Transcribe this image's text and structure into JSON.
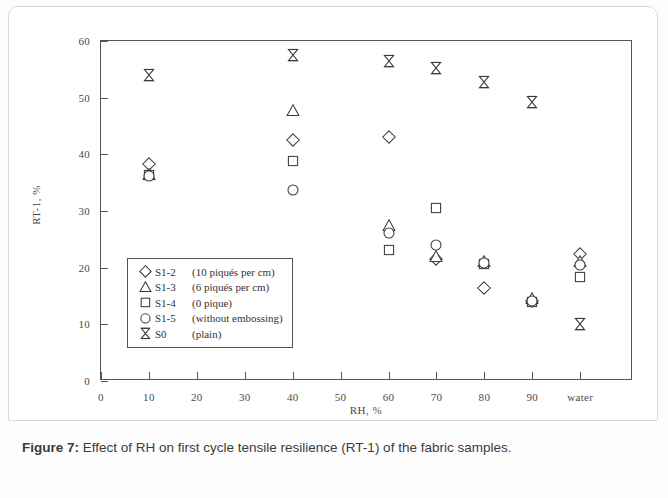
{
  "figure": {
    "caption_label": "Figure 7:",
    "caption_text": " Effect of RH on first cycle tensile resilience (RT-1) of the fabric samples."
  },
  "chart_data": {
    "type": "scatter",
    "title": "",
    "xlabel": "RH, %",
    "ylabel": "RT-1, %",
    "xticklabels": [
      "0",
      "10",
      "20",
      "30",
      "40",
      "50",
      "60",
      "70",
      "80",
      "90",
      "water"
    ],
    "xtickvalues": [
      0,
      10,
      20,
      30,
      40,
      50,
      60,
      70,
      80,
      90,
      100
    ],
    "yticklabels": [
      "0",
      "10",
      "20",
      "30",
      "40",
      "50",
      "60"
    ],
    "ytickvalues": [
      0,
      10,
      20,
      30,
      40,
      50,
      60
    ],
    "xlim": [
      0,
      111
    ],
    "ylim": [
      0,
      60
    ],
    "grid": false,
    "legend_position": "inside-lower-left",
    "series": [
      {
        "name": "S1-2",
        "label": "S1-2  (10 piqués per cm)",
        "marker": "diamond",
        "x": [
          10,
          40,
          60,
          70,
          80,
          90,
          100
        ],
        "y": [
          38.3,
          42.5,
          43.1,
          21.6,
          16.4,
          14.2,
          22.5
        ]
      },
      {
        "name": "S1-3",
        "label": "S1-3  (6 piqués per cm)",
        "marker": "triangle",
        "x": [
          10,
          40,
          60,
          70,
          80,
          90,
          100
        ],
        "y": [
          36.4,
          47.6,
          27.4,
          21.8,
          21.0,
          14.4,
          21.0
        ]
      },
      {
        "name": "S1-4",
        "label": "S1-4  (0 pique)",
        "marker": "square",
        "x": [
          10,
          40,
          60,
          70,
          80,
          90,
          100
        ],
        "y": [
          36.3,
          38.9,
          23.2,
          30.5,
          20.6,
          13.9,
          18.3
        ]
      },
      {
        "name": "S1-5",
        "label": "S1-5  (without embossing)",
        "marker": "circle",
        "x": [
          10,
          40,
          60,
          70,
          80,
          90,
          100
        ],
        "y": [
          36.2,
          33.7,
          26.1,
          24.0,
          20.8,
          14.1,
          20.4
        ]
      },
      {
        "name": "S0",
        "label": "S0    (plain)",
        "marker": "bowtie",
        "x": [
          10,
          40,
          60,
          70,
          80,
          90,
          100
        ],
        "y": [
          54.0,
          57.6,
          56.5,
          55.3,
          52.7,
          49.3,
          10.0
        ]
      }
    ],
    "legend_entries": [
      {
        "marker": "diamond",
        "name": "S1-2",
        "desc": "(10 piqués per cm)"
      },
      {
        "marker": "triangle",
        "name": "S1-3",
        "desc": "(6 piqués per cm)"
      },
      {
        "marker": "square",
        "name": "S1-4",
        "desc": "(0 pique)"
      },
      {
        "marker": "circle",
        "name": "S1-5",
        "desc": "(without embossing)"
      },
      {
        "marker": "bowtie",
        "name": "S0",
        "desc": "(plain)"
      }
    ],
    "colors": {
      "marker_stroke": "#3c3c3c",
      "axis": "#555555",
      "text": "#4a4a4a"
    }
  }
}
